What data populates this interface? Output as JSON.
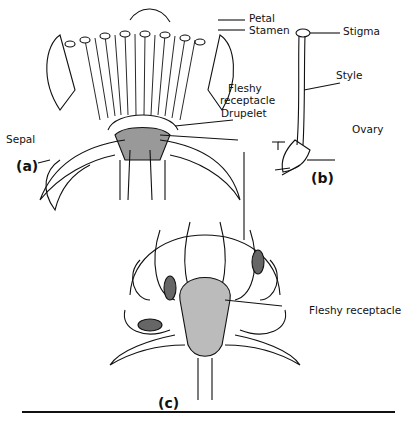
{
  "figure": {
    "panels": [
      {
        "id": "a",
        "label": "(a)"
      },
      {
        "id": "b",
        "label": "(b)"
      },
      {
        "id": "c",
        "label": "(c)"
      }
    ],
    "labels": {
      "petal": "Petal",
      "stamen": "Stamen",
      "fleshy_receptacle_a": "Fleshy\nreceptacle",
      "fleshy_receptacle_a_line1": "Fleshy",
      "fleshy_receptacle_a_line2": "receptacle",
      "drupelet": "Drupelet",
      "sepal": "Sepal",
      "stigma": "Stigma",
      "style": "Style",
      "ovary": "Ovary",
      "fleshy_receptacle_c": "Fleshy receptacle"
    }
  }
}
